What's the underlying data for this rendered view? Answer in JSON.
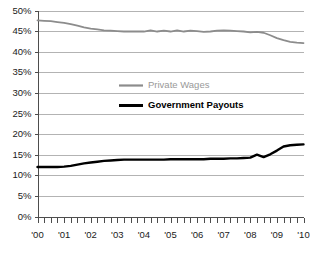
{
  "chart_data": {
    "type": "line",
    "title": "",
    "xlabel": "",
    "ylabel": "",
    "xlim": [
      2000,
      2010
    ],
    "ylim": [
      0,
      0.5
    ],
    "ytick_labels": [
      "50%",
      "45%",
      "40%",
      "35%",
      "30%",
      "25%",
      "20%",
      "15%",
      "10%",
      "5%",
      "0%"
    ],
    "ytick_values": [
      50,
      45,
      40,
      35,
      30,
      25,
      20,
      15,
      10,
      5,
      0
    ],
    "xtick_labels": [
      "'00",
      "'01",
      "'02",
      "'03",
      "'04",
      "'05",
      "'06",
      "'07",
      "'08",
      "'09",
      "'10"
    ],
    "xtick_values": [
      2000,
      2001,
      2002,
      2003,
      2004,
      2005,
      2006,
      2007,
      2008,
      2009,
      2010
    ],
    "minor_ticks_per_interval": 4,
    "grid": "horizontal",
    "legend_position": "center",
    "colors": {
      "private_wages": "#8c8c8c",
      "government_payouts": "#000000",
      "gridline": "#b3b3b3",
      "axis": "#4d4d4d",
      "background": "#ffffff"
    },
    "x": [
      2000.0,
      2000.25,
      2000.5,
      2000.75,
      2001.0,
      2001.25,
      2001.5,
      2001.75,
      2002.0,
      2002.25,
      2002.5,
      2002.75,
      2003.0,
      2003.25,
      2003.5,
      2003.75,
      2004.0,
      2004.25,
      2004.5,
      2004.75,
      2005.0,
      2005.25,
      2005.5,
      2005.75,
      2006.0,
      2006.25,
      2006.5,
      2006.75,
      2007.0,
      2007.25,
      2007.5,
      2007.75,
      2008.0,
      2008.25,
      2008.5,
      2008.75,
      2009.0,
      2009.25,
      2009.5,
      2009.75,
      2010.0
    ],
    "series": [
      {
        "name": "Private Wages",
        "color": "#8c8c8c",
        "values": [
          47.6,
          47.5,
          47.4,
          47.2,
          47.0,
          46.7,
          46.3,
          45.9,
          45.6,
          45.4,
          45.2,
          45.1,
          45.0,
          44.9,
          44.9,
          44.9,
          44.9,
          45.2,
          44.9,
          45.1,
          44.9,
          45.2,
          44.9,
          45.1,
          45.0,
          44.8,
          44.9,
          45.1,
          45.2,
          45.1,
          45.0,
          44.9,
          44.7,
          44.8,
          44.6,
          44.0,
          43.3,
          42.8,
          42.4,
          42.2,
          42.1
        ]
      },
      {
        "name": "Government Payouts",
        "color": "#000000",
        "values": [
          12.0,
          12.0,
          12.0,
          12.0,
          12.1,
          12.3,
          12.6,
          12.9,
          13.1,
          13.3,
          13.5,
          13.6,
          13.7,
          13.8,
          13.8,
          13.8,
          13.8,
          13.8,
          13.8,
          13.8,
          13.9,
          13.9,
          13.9,
          13.9,
          13.9,
          13.9,
          14.0,
          14.0,
          14.0,
          14.1,
          14.1,
          14.2,
          14.3,
          15.0,
          14.4,
          15.1,
          16.0,
          17.0,
          17.3,
          17.4,
          17.5
        ]
      }
    ],
    "legend": [
      {
        "label": "Private Wages",
        "color": "#8c8c8c",
        "style": "gray"
      },
      {
        "label": "Government Payouts",
        "color": "#000000",
        "style": "black-bold"
      }
    ]
  }
}
